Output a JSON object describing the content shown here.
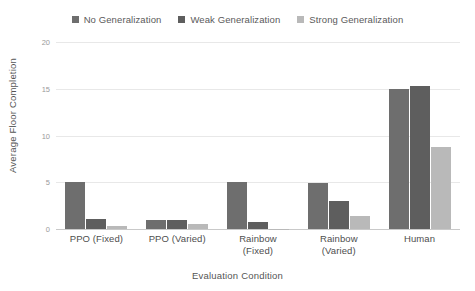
{
  "chart_data": {
    "type": "bar",
    "title": "",
    "xlabel": "Evaluation Condition",
    "ylabel": "Average Floor Completion",
    "categories": [
      "PPO (Fixed)",
      "PPO (Varied)",
      "Rainbow (Fixed)",
      "Rainbow (Varied)",
      "Human"
    ],
    "category_lines": [
      [
        "PPO (Fixed)",
        ""
      ],
      [
        "PPO (Varied)",
        ""
      ],
      [
        "Rainbow",
        "(Fixed)"
      ],
      [
        "Rainbow",
        "(Varied)"
      ],
      [
        "Human",
        ""
      ]
    ],
    "series": [
      {
        "name": "No Generalization",
        "color": "#6e6e6e",
        "values": [
          5.0,
          1.0,
          5.0,
          4.9,
          15.0
        ]
      },
      {
        "name": "Weak Generalization",
        "color": "#5e5e5e",
        "values": [
          1.1,
          1.0,
          0.7,
          3.0,
          15.3
        ]
      },
      {
        "name": "Strong Generalization",
        "color": "#b9b9b9",
        "values": [
          0.35,
          0.5,
          0.05,
          1.4,
          8.8
        ]
      }
    ],
    "ylim": [
      0,
      20
    ],
    "yticks": [
      0,
      5,
      10,
      15,
      20
    ],
    "ytick_labels": [
      "0",
      "5",
      "10",
      "15",
      "20"
    ],
    "grid": true,
    "legend_position": "top-center"
  }
}
